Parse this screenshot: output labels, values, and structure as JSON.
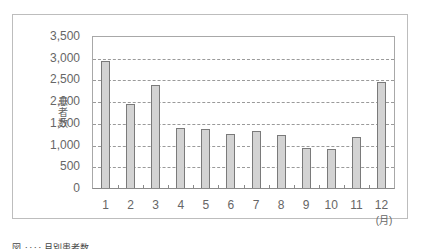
{
  "chart_data": {
    "type": "bar",
    "title": "",
    "xlabel": "(月)",
    "ylabel": "患者数",
    "categories": [
      "1",
      "2",
      "3",
      "4",
      "5",
      "6",
      "7",
      "8",
      "9",
      "10",
      "11",
      "12"
    ],
    "values": [
      2930,
      1930,
      2380,
      1390,
      1350,
      1250,
      1310,
      1220,
      920,
      890,
      1180,
      2440
    ],
    "ylim": [
      0,
      3500
    ],
    "yticks": [
      "0",
      "500",
      "1,000",
      "1,500",
      "2,000",
      "2,500",
      "3,000",
      "3,500"
    ],
    "grid": "horizontal dashed",
    "legend": "none",
    "bar_color": "#d3d3d3",
    "bar_edge_color": "#7a7a7a"
  },
  "caption": "図 ‥‥ 月別患者数"
}
